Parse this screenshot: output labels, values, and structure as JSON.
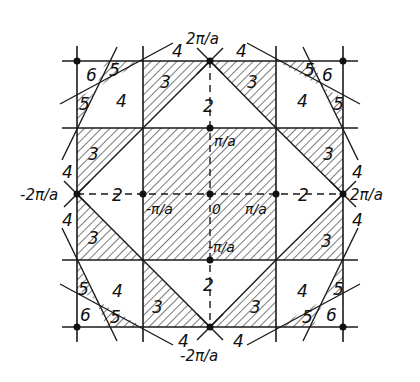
{
  "figure": {
    "colors": {
      "line": "#1a1a1a",
      "hatch": "#333333",
      "background": "#ffffff"
    }
  },
  "axis_labels": {
    "top": "2π/a",
    "bottom": "-2π/a",
    "left": "-2π/a",
    "right": "2π/a",
    "inner_top": "π/a",
    "inner_bottom": "-π/a",
    "inner_left": "-π/a",
    "inner_right": "π/a",
    "origin": "0"
  },
  "zone_labels": {
    "z2_top": "2",
    "z2_bottom": "2",
    "z2_left": "2",
    "z2_right": "2",
    "z3_tl": "3",
    "z3_tr": "3",
    "z3_lt": "3",
    "z3_lb": "3",
    "z3_rt": "3",
    "z3_rb": "3",
    "z3_bl": "3",
    "z3_br": "3",
    "z4_c_tl": "4",
    "z4_c_tr": "4",
    "z4_c_bl": "4",
    "z4_c_br": "4",
    "z4_o_tl": "4",
    "z4_o_tr": "4",
    "z4_o_lt": "4",
    "z4_o_lb": "4",
    "z4_o_rt": "4",
    "z4_o_rb": "4",
    "z4_o_bl": "4",
    "z4_o_br": "4",
    "z5_tl_a": "5",
    "z5_tl_b": "5",
    "z5_tr_a": "5",
    "z5_tr_b": "5",
    "z5_bl_a": "5",
    "z5_bl_b": "5",
    "z5_br_a": "5",
    "z5_br_b": "5",
    "z6_tl": "6",
    "z6_tr": "6",
    "z6_bl": "6",
    "z6_br": "6"
  }
}
